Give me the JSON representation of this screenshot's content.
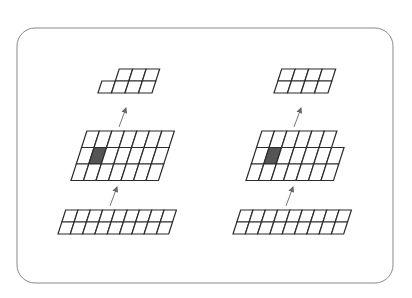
{
  "diagram": {
    "frame": {
      "x": 17,
      "y": 28,
      "w": 376,
      "h": 255,
      "rx": 18,
      "stroke": "#8a8a8a"
    },
    "colors": {
      "grid_stroke": "#2b2b2b",
      "cell_fill": "#ffffff",
      "highlight_fill": "#555555",
      "arrow": "#666666"
    },
    "skew": 0.32,
    "stacks": [
      {
        "name": "left-stack",
        "grids": [
          {
            "name": "left-top-grid",
            "x": 98,
            "y": 69,
            "cw": 13.5,
            "ch": 12,
            "rows": [
              {
                "start": 1,
                "count": 3
              },
              {
                "start": 0,
                "count": 4
              }
            ],
            "highlight": []
          },
          {
            "name": "left-middle-grid",
            "x": 71,
            "y": 131,
            "cw": 12.5,
            "ch": 16.5,
            "rows": [
              {
                "start": 0,
                "count": 7
              },
              {
                "start": 0,
                "count": 7
              },
              {
                "start": 0,
                "count": 7
              }
            ],
            "highlight": [
              [
                1,
                1
              ]
            ]
          },
          {
            "name": "left-bottom-grid",
            "x": 58,
            "y": 210,
            "cw": 12.3,
            "ch": 12,
            "rows": [
              {
                "start": 0,
                "count": 9
              },
              {
                "start": 0,
                "count": 9
              }
            ],
            "highlight": []
          }
        ],
        "arrows": [
          {
            "x1": 119,
            "y1": 127,
            "x2": 126,
            "y2": 108
          },
          {
            "x1": 110,
            "y1": 206,
            "x2": 117,
            "y2": 187
          }
        ]
      },
      {
        "name": "right-stack",
        "grids": [
          {
            "name": "right-top-grid",
            "x": 274,
            "y": 69,
            "cw": 13.5,
            "ch": 12,
            "rows": [
              {
                "start": 0,
                "count": 4
              },
              {
                "start": 0,
                "count": 4
              }
            ],
            "highlight": []
          },
          {
            "name": "right-middle-grid",
            "x": 246,
            "y": 131,
            "cw": 12.5,
            "ch": 16.5,
            "rows": [
              {
                "start": 0,
                "count": 6
              },
              {
                "start": 0,
                "count": 7
              },
              {
                "start": 0,
                "count": 7
              }
            ],
            "highlight": [
              [
                1,
                1
              ]
            ]
          },
          {
            "name": "right-bottom-grid",
            "x": 233,
            "y": 210,
            "cw": 12.3,
            "ch": 12,
            "rows": [
              {
                "start": 0,
                "count": 9
              },
              {
                "start": 0,
                "count": 9
              }
            ],
            "highlight": []
          }
        ],
        "arrows": [
          {
            "x1": 294,
            "y1": 127,
            "x2": 301,
            "y2": 108
          },
          {
            "x1": 286,
            "y1": 206,
            "x2": 293,
            "y2": 187
          }
        ]
      }
    ]
  }
}
